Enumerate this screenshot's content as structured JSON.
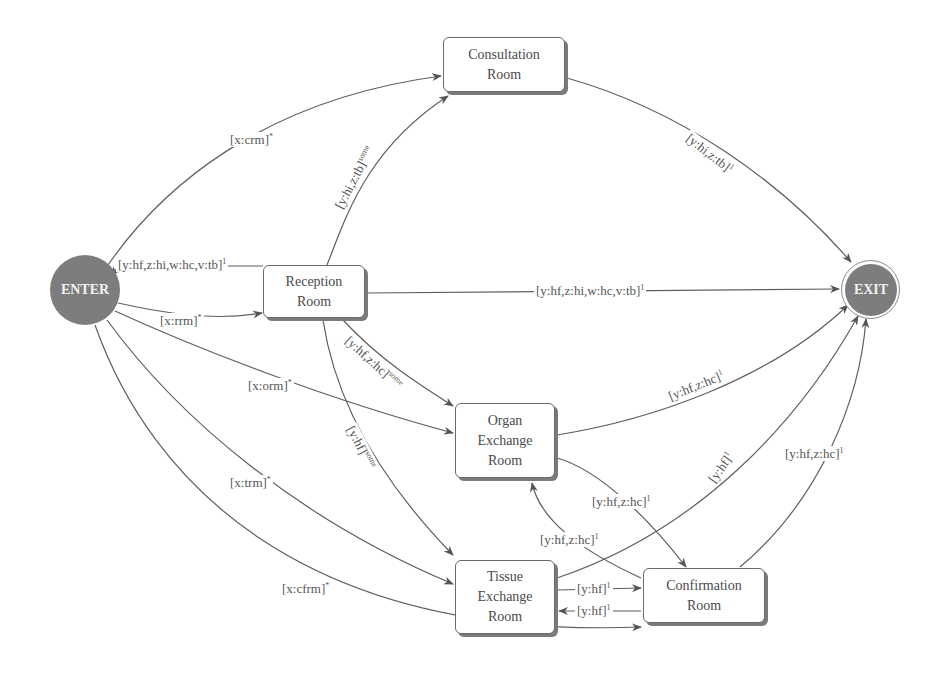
{
  "diagram": {
    "type": "state-transition-diagram",
    "nodes": {
      "enter": {
        "label": "ENTER"
      },
      "exit": {
        "label": "EXIT"
      },
      "consultation": {
        "line1": "Consultation",
        "line2": "Room"
      },
      "reception": {
        "line1": "Reception",
        "line2": "Room"
      },
      "organ": {
        "line1": "Organ",
        "line2": "Exchange",
        "line3": "Room"
      },
      "tissue": {
        "line1": "Tissue",
        "line2": "Exchange",
        "line3": "Room"
      },
      "confirmation": {
        "line1": "Confirmation",
        "line2": "Room"
      }
    },
    "edges": [
      {
        "id": "enter-consultation",
        "from": "ENTER",
        "to": "Consultation Room",
        "label": "[x:crm]",
        "sup": "*"
      },
      {
        "id": "reception-consultation",
        "from": "Reception Room",
        "to": "Consultation Room",
        "label": "[y:hi,z:tb]",
        "sup": "some"
      },
      {
        "id": "consultation-exit",
        "from": "Consultation Room",
        "to": "EXIT",
        "label": "[y:hi,z:tb]",
        "sup": "1"
      },
      {
        "id": "reception-enter",
        "from": "Reception Room",
        "to": "ENTER",
        "label": "[y:hf,z:hi,w:hc,v:tb]",
        "sup": "1"
      },
      {
        "id": "enter-reception",
        "from": "ENTER",
        "to": "Reception Room",
        "label": "[x:rrm]",
        "sup": "*"
      },
      {
        "id": "reception-exit",
        "from": "Reception Room",
        "to": "EXIT",
        "label": "[y:hf,z:hi,w:hc,v:tb]",
        "sup": "1"
      },
      {
        "id": "enter-organ",
        "from": "ENTER",
        "to": "Organ Exchange Room",
        "label": "[x:orm]",
        "sup": "*"
      },
      {
        "id": "reception-organ",
        "from": "Reception Room",
        "to": "Organ Exchange Room",
        "label": "[y:hf,z:hc]",
        "sup": "some"
      },
      {
        "id": "reception-tissue",
        "from": "Reception Room",
        "to": "Tissue Exchange Room",
        "label": "[y:hf]",
        "sup": "some"
      },
      {
        "id": "organ-exit",
        "from": "Organ Exchange Room",
        "to": "EXIT",
        "label": "[y:hf,z:hc]",
        "sup": "1"
      },
      {
        "id": "enter-tissue",
        "from": "ENTER",
        "to": "Tissue Exchange Room",
        "label": "[x:trm]",
        "sup": "*"
      },
      {
        "id": "enter-confirmation",
        "from": "ENTER",
        "to": "Confirmation Room",
        "label": "[x:cfrm]",
        "sup": "*"
      },
      {
        "id": "organ-confirmation",
        "from": "Organ Exchange Room",
        "to": "Confirmation Room",
        "label": "[y:hf,z:hc]",
        "sup": "1"
      },
      {
        "id": "confirmation-organ",
        "from": "Confirmation Room",
        "to": "Organ Exchange Room",
        "label": "[y:hf,z:hc]",
        "sup": "1"
      },
      {
        "id": "tissue-exit",
        "from": "Tissue Exchange Room",
        "to": "EXIT",
        "label": "[y:hf]",
        "sup": "1"
      },
      {
        "id": "tissue-confirmation",
        "from": "Tissue Exchange Room",
        "to": "Confirmation Room",
        "label": "[y:hf]",
        "sup": "1"
      },
      {
        "id": "confirmation-tissue",
        "from": "Confirmation Room",
        "to": "Tissue Exchange Room",
        "label": "[y:hf]",
        "sup": "1"
      },
      {
        "id": "confirmation-exit",
        "from": "Confirmation Room",
        "to": "EXIT",
        "label": "[y:hf,z:hc]",
        "sup": "1"
      }
    ],
    "labels": {
      "l0": {
        "text": "[x:crm]",
        "sup": "*"
      },
      "l1": {
        "text": "[y:hi,z:tb]",
        "sup": "some"
      },
      "l2": {
        "text": "[y:hi,z:tb]",
        "sup": "1"
      },
      "l3": {
        "text": "[y:hf,z:hi,w:hc,v:tb]",
        "sup": "1"
      },
      "l4": {
        "text": "[x:rrm]",
        "sup": "*"
      },
      "l5": {
        "text": "[y:hf,z:hi,w:hc,v:tb]",
        "sup": "1"
      },
      "l6": {
        "text": "[x:orm]",
        "sup": "*"
      },
      "l7": {
        "text": "[y:hf,z:hc]",
        "sup": "some"
      },
      "l8": {
        "text": "[y:hf]",
        "sup": "some"
      },
      "l9": {
        "text": "[y:hf,z:hc]",
        "sup": "1"
      },
      "l10": {
        "text": "[x:trm]",
        "sup": "*"
      },
      "l11": {
        "text": "[x:cfrm]",
        "sup": "*"
      },
      "l12": {
        "text": "[y:hf,z:hc]",
        "sup": "1"
      },
      "l13": {
        "text": "[y:hf,z:hc]",
        "sup": "1"
      },
      "l14": {
        "text": "[y:hf]",
        "sup": "1"
      },
      "l15": {
        "text": "[y:hf]",
        "sup": "1"
      },
      "l16": {
        "text": "[y:hf]",
        "sup": "1"
      },
      "l17": {
        "text": "[y:hf,z:hc]",
        "sup": "1"
      }
    },
    "colors": {
      "terminal_fill": "#7d7d7d",
      "edge": "#5a5a5a",
      "box_border": "#6a6a6a",
      "box_shadow": "#7a7a7a",
      "text": "#4a4a4a"
    }
  }
}
